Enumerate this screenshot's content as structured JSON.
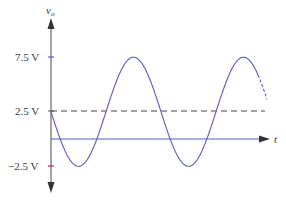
{
  "chart_data": {
    "type": "line",
    "title": "",
    "xlabel": "t",
    "ylabel": "v_o",
    "ylabel_main": "v",
    "ylabel_sub": "o",
    "y_ticks": [
      {
        "value": 7.5,
        "label": "7.5 V"
      },
      {
        "value": 2.5,
        "label": "2.5 V"
      },
      {
        "value": -2.5,
        "label": "−2.5 V"
      }
    ],
    "ylim": [
      -3.5,
      11
    ],
    "grid": false,
    "legend": null,
    "series": [
      {
        "name": "v_o(t)",
        "function": "2.5 - 5*sin(2*pi*t/T)",
        "dc_offset": 2.5,
        "amplitude": 5,
        "max": 7.5,
        "min": -2.5,
        "periods_shown": 1.95,
        "color": "#5b5bbf",
        "style": "solid",
        "tail_style": "dashed"
      },
      {
        "name": "DC level",
        "value": 2.5,
        "color": "#333333",
        "style": "dashed"
      }
    ],
    "x_axis_color": "#5b5bbf",
    "y_axis_color": "#555555",
    "tick_color_upper": "#5b5bbf",
    "tick_color_lower": "#b03060"
  }
}
